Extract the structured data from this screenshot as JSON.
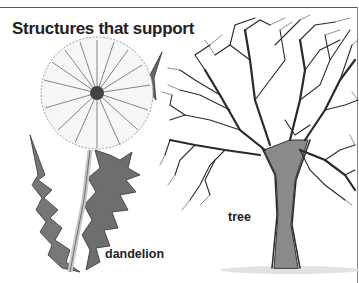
{
  "figure": {
    "title": "Structures that support",
    "labels": {
      "dandelion": "dandelion",
      "tree": "tree"
    },
    "illustrations": [
      "dandelion-seed-head",
      "bare-deciduous-tree"
    ],
    "colors": {
      "ink": "#222222",
      "background": "#ffffff",
      "leaf_gray": "#6e6e6e",
      "trunk_gray": "#7a7a7a"
    }
  }
}
